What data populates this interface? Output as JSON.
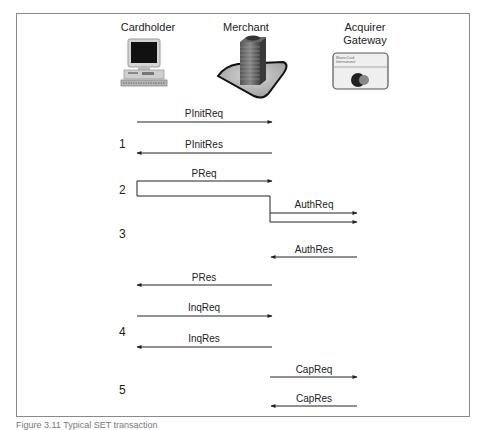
{
  "actors": [
    {
      "id": "cardholder",
      "label": "Cardholder",
      "icon": "computer-icon"
    },
    {
      "id": "merchant",
      "label": "Merchant",
      "icon": "office-building-icon"
    },
    {
      "id": "acquirer",
      "label": "Acquirer\nGateway",
      "label_line1": "Acquirer",
      "label_line2": "Gateway",
      "icon": "mastercard-card-icon",
      "card_text_line1": "MasterCard",
      "card_text_line2": "International"
    }
  ],
  "messages": [
    {
      "label": "PInitReq",
      "from": "cardholder",
      "to": "merchant"
    },
    {
      "label": "PInitRes",
      "from": "merchant",
      "to": "cardholder"
    },
    {
      "label": "PReq",
      "from": "cardholder",
      "to": "merchant"
    },
    {
      "label": "AuthReq",
      "from": "merchant",
      "to": "acquirer"
    },
    {
      "label": "AuthRes",
      "from": "acquirer",
      "to": "merchant"
    },
    {
      "label": "PRes",
      "from": "merchant",
      "to": "cardholder"
    },
    {
      "label": "InqReq",
      "from": "cardholder",
      "to": "merchant"
    },
    {
      "label": "InqRes",
      "from": "merchant",
      "to": "cardholder"
    },
    {
      "label": "CapReq",
      "from": "merchant",
      "to": "acquirer"
    },
    {
      "label": "CapRes",
      "from": "acquirer",
      "to": "merchant"
    }
  ],
  "steps": [
    "1",
    "2",
    "3",
    "4",
    "5"
  ],
  "caption": "Figure 3.11  Typical SET transaction"
}
